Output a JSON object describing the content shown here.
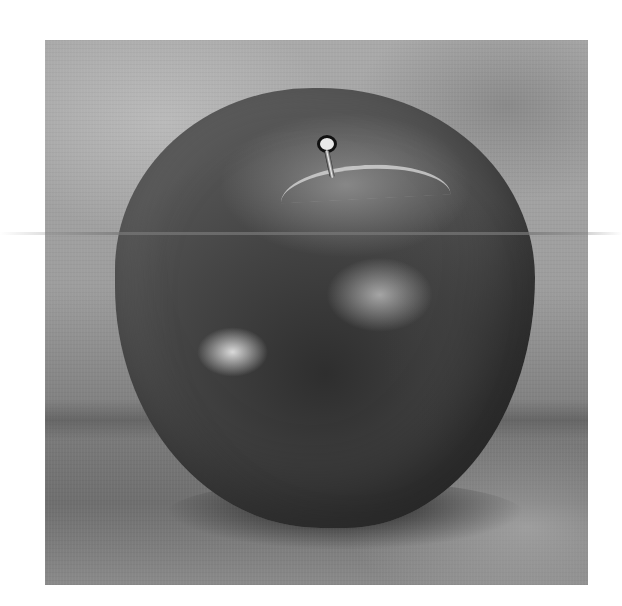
{
  "image": {
    "subject": "Grayscale oil painting of an apple on a table",
    "background_color": "#ffffff",
    "palette": [
      "#a9a9a9",
      "#7c7c7c",
      "#2e2e2e",
      "#e8e8e8"
    ]
  }
}
